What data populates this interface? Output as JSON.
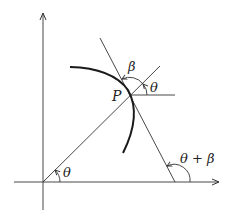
{
  "diagram": {
    "labels": {
      "point": "P",
      "theta_origin": "θ",
      "theta_at_p": "θ",
      "beta": "β",
      "theta_plus_beta": "θ + β"
    },
    "colors": {
      "line": "#333333",
      "curve": "#1a1a1a",
      "background": "#ffffff"
    }
  }
}
